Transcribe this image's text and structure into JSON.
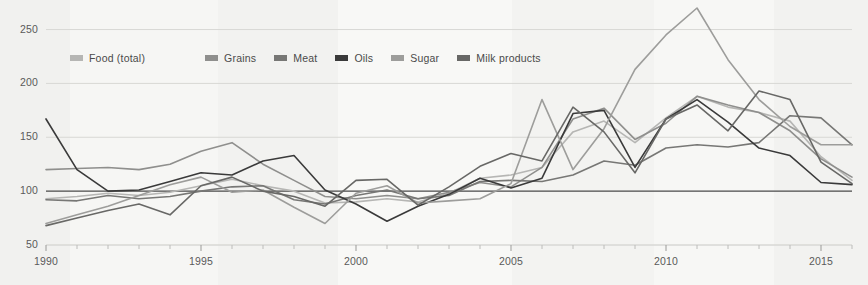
{
  "chart_data": {
    "type": "line",
    "title": "",
    "subtitle": "",
    "xlabel": "",
    "ylabel": "",
    "xlim": [
      1990,
      2016
    ],
    "ylim": [
      50,
      270
    ],
    "y_ticks": [
      50,
      100,
      150,
      200,
      250
    ],
    "x_ticks": [
      1990,
      1995,
      2000,
      2005,
      2010,
      2015
    ],
    "x_minor_ticks": [
      1991,
      1992,
      1993,
      1994,
      1996,
      1997,
      1998,
      1999,
      2001,
      2002,
      2003,
      2004,
      2006,
      2007,
      2008,
      2009,
      2011,
      2012,
      2013,
      2014,
      2016
    ],
    "grid": "horizontal",
    "baseline_value": 100,
    "legend_position": "top-left",
    "x": [
      1990,
      1991,
      1992,
      1993,
      1994,
      1995,
      1996,
      1997,
      1998,
      1999,
      2000,
      2001,
      2002,
      2003,
      2004,
      2005,
      2006,
      2007,
      2008,
      2009,
      2010,
      2011,
      2012,
      2013,
      2014,
      2015,
      2016
    ],
    "series": [
      {
        "name": "Food (total)",
        "color": "#b6b6b4",
        "values": [
          93,
          95,
          98,
          96,
          99,
          105,
          111,
          105,
          100,
          89,
          90,
          93,
          90,
          98,
          112,
          115,
          122,
          155,
          165,
          145,
          168,
          188,
          178,
          173,
          165,
          132,
          110
        ]
      },
      {
        "name": "Grains",
        "color": "#8f8f8d",
        "values": [
          120,
          121,
          122,
          120,
          125,
          137,
          145,
          125,
          110,
          95,
          93,
          96,
          93,
          99,
          108,
          104,
          122,
          167,
          177,
          148,
          163,
          188,
          180,
          173,
          156,
          130,
          113
        ]
      },
      {
        "name": "Meat",
        "color": "#777775",
        "values": [
          92,
          91,
          96,
          93,
          95,
          100,
          104,
          105,
          92,
          88,
          96,
          101,
          93,
          96,
          109,
          110,
          109,
          115,
          128,
          124,
          140,
          143,
          141,
          145,
          170,
          168,
          143
        ]
      },
      {
        "name": "Oils",
        "color": "#3a3a3a",
        "values": [
          167,
          120,
          100,
          101,
          109,
          117,
          115,
          128,
          133,
          101,
          88,
          72,
          86,
          97,
          112,
          103,
          112,
          172,
          175,
          122,
          167,
          185,
          164,
          140,
          133,
          108,
          106
        ]
      },
      {
        "name": "Sugar",
        "color": "#9d9d9b",
        "values": [
          70,
          78,
          86,
          96,
          106,
          113,
          99,
          101,
          85,
          70,
          98,
          105,
          89,
          91,
          93,
          107,
          185,
          120,
          158,
          213,
          245,
          270,
          222,
          185,
          160,
          143,
          143
        ]
      },
      {
        "name": "Milk products",
        "color": "#686866",
        "values": [
          68,
          75,
          82,
          88,
          78,
          105,
          113,
          100,
          95,
          86,
          110,
          111,
          87,
          104,
          123,
          135,
          128,
          178,
          155,
          117,
          167,
          180,
          156,
          193,
          185,
          127,
          107
        ]
      }
    ]
  },
  "axes": {
    "y_tick_labels": [
      "50",
      "100",
      "150",
      "200",
      "250"
    ],
    "x_tick_labels": [
      "1990",
      "1995",
      "2000",
      "2005",
      "2010",
      "2015"
    ]
  },
  "legend": {
    "items": [
      {
        "label": "Food (total)",
        "color": "#b6b6b4"
      },
      {
        "label": "Grains",
        "color": "#8f8f8d"
      },
      {
        "label": "Meat",
        "color": "#777775"
      },
      {
        "label": "Oils",
        "color": "#3a3a3a"
      },
      {
        "label": "Sugar",
        "color": "#9d9d9b"
      },
      {
        "label": "Milk products",
        "color": "#686866"
      }
    ]
  },
  "colors": {
    "background": "#f7f7f5",
    "gridline": "#d8d8d5",
    "baseline": "#4a4a4a",
    "axis_text": "#5a5a5a"
  }
}
